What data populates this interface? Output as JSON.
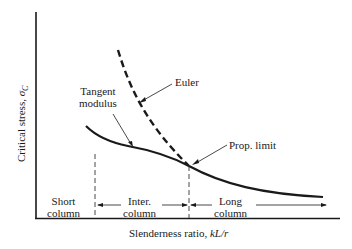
{
  "diagram": {
    "type": "column buckling curve",
    "axes": {
      "x_label": "Slenderness ratio, ",
      "x_label_var": "kL/r",
      "y_label": "Critical stress, ",
      "y_label_var": "σ",
      "y_label_sub": "C"
    },
    "curves": [
      {
        "name": "Euler",
        "style": "dashed"
      },
      {
        "name": "Tangent modulus",
        "style": "solid"
      }
    ],
    "annotations": {
      "euler": "Euler",
      "tangent_line1": "Tangent",
      "tangent_line2": "modulus",
      "prop_limit": "Prop. limit"
    },
    "regions": [
      {
        "line1": "Short",
        "line2": "column"
      },
      {
        "line1": "Inter.",
        "line2": "column"
      },
      {
        "line1": "Long",
        "line2": "column"
      }
    ],
    "colors": {
      "ink": "#1a1a1a",
      "background": "#ffffff"
    }
  }
}
